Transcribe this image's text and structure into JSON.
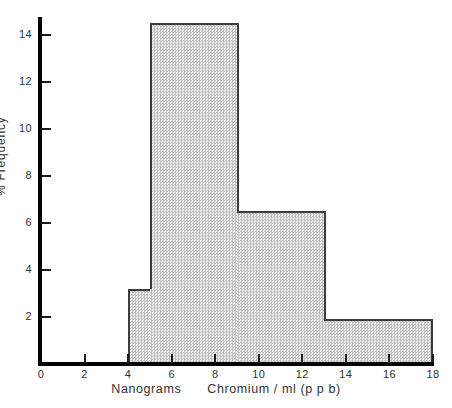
{
  "chart_data": {
    "type": "bar",
    "title": "",
    "subtitle": "",
    "xlabel": "Nanograms    Chromium / ml  (p p b)",
    "xlabel_parts": {
      "units": "Nanograms",
      "main": "Chromium / ml  (p p b)"
    },
    "ylabel": "% Frequency",
    "xlim": [
      0,
      18
    ],
    "ylim": [
      0,
      15.3
    ],
    "xticks": [
      0,
      2,
      4,
      6,
      8,
      10,
      12,
      14,
      16,
      18
    ],
    "xticklabels": [
      "0",
      "2",
      "4",
      "6",
      "8",
      "10",
      "12",
      "14",
      "16",
      "18"
    ],
    "yticks": [
      2,
      4,
      6,
      8,
      10,
      12,
      14
    ],
    "yticklabels": [
      "2",
      "4",
      "6",
      "8",
      "10",
      "12",
      "14"
    ],
    "grid": false,
    "legend": "none",
    "bin_edges": [
      4,
      5,
      9,
      13,
      18
    ],
    "categories": [
      "4-5",
      "5-9",
      "9-13",
      "13-18"
    ],
    "values": [
      3.2,
      14.5,
      6.5,
      1.9
    ],
    "bars": [
      {
        "label": "4-5",
        "x0": 4,
        "x1": 5,
        "height": 3.2
      },
      {
        "label": "5-9",
        "x0": 5,
        "x1": 9,
        "height": 14.5
      },
      {
        "label": "9-13",
        "x0": 9,
        "x1": 13,
        "height": 6.5
      },
      {
        "label": "13-18",
        "x0": 13,
        "x1": 18,
        "height": 1.9
      }
    ],
    "bar_fill_color": "#d2d2d2",
    "bar_edge_color": "#3c3c3c",
    "axis_color": "#000000"
  }
}
